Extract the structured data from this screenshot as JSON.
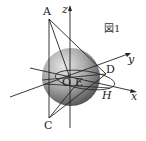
{
  "figure": {
    "caption": "図1",
    "points": {
      "A": "A",
      "C": "C",
      "D": "D",
      "O": "O",
      "E": "E",
      "H": "H"
    },
    "axes": {
      "x": "x",
      "y": "y",
      "z": "z"
    }
  }
}
